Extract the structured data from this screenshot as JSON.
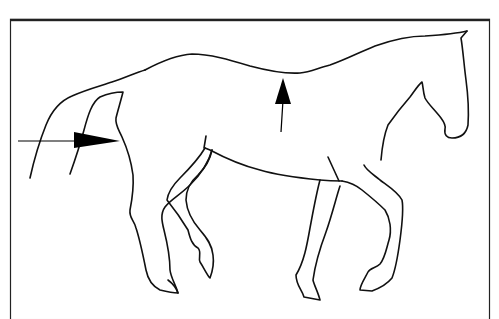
{
  "figure": {
    "frame": {
      "x": 10,
      "y": 10,
      "width": 480,
      "height": 143,
      "stroke": "#222222"
    },
    "colors": {
      "line": "#111111",
      "background": "#ffffff",
      "arrow": "#000000"
    },
    "arrows": [
      {
        "name": "hindquarter-push-arrow",
        "direction": "right",
        "from": [
          18,
          141
        ],
        "to": [
          120,
          141
        ]
      },
      {
        "name": "back-lift-arrow",
        "direction": "up",
        "from": [
          281,
          132
        ],
        "to": [
          283,
          78
        ]
      }
    ]
  }
}
